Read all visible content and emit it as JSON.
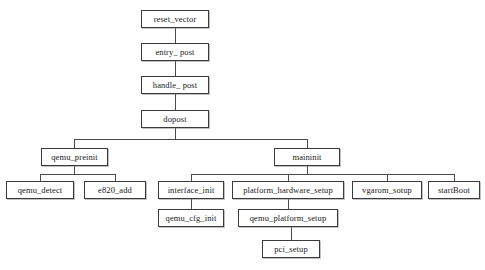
{
  "diagram": {
    "type": "flowchart-tree",
    "background_color": "#ffffff",
    "box_border_color": "#3a3a3a",
    "edge_color": "#4a4a4a",
    "text_color": "#1a1a1a",
    "nodes": [
      {
        "id": "reset_vector",
        "label": "reset_vector",
        "x": 141,
        "y": 10,
        "w": 68,
        "h": 18,
        "level": 0
      },
      {
        "id": "entry_post",
        "label": "entry_ post",
        "x": 141,
        "y": 43,
        "w": 68,
        "h": 18,
        "level": 1
      },
      {
        "id": "handle_post",
        "label": "handle_ post",
        "x": 141,
        "y": 76,
        "w": 68,
        "h": 18,
        "level": 2
      },
      {
        "id": "dopost",
        "label": "dopost",
        "x": 141,
        "y": 110,
        "w": 68,
        "h": 18,
        "level": 3
      },
      {
        "id": "qemu_preinit",
        "label": "qemu_preinit",
        "x": 41,
        "y": 148,
        "w": 67,
        "h": 18,
        "level": 4
      },
      {
        "id": "maininit",
        "label": "maininit",
        "x": 274,
        "y": 148,
        "w": 66,
        "h": 18,
        "level": 4
      },
      {
        "id": "qemu_detect",
        "label": "qemu_detect",
        "x": 6,
        "y": 181,
        "w": 68,
        "h": 18,
        "level": 5
      },
      {
        "id": "e820_add",
        "label": "e820_add",
        "x": 84,
        "y": 181,
        "w": 62,
        "h": 18,
        "level": 5
      },
      {
        "id": "interface_init",
        "label": "interface_init",
        "x": 158,
        "y": 181,
        "w": 66,
        "h": 18,
        "level": 5
      },
      {
        "id": "platform_hardware_setup",
        "label": "platform_hardware_setup",
        "x": 232,
        "y": 181,
        "w": 112,
        "h": 18,
        "level": 5
      },
      {
        "id": "vgarom_sotup",
        "label": "vgarom_sotup",
        "x": 352,
        "y": 181,
        "w": 70,
        "h": 18,
        "level": 5
      },
      {
        "id": "startBoot",
        "label": "startBoot",
        "x": 428,
        "y": 181,
        "w": 52,
        "h": 18,
        "level": 5
      },
      {
        "id": "qemu_cfg_init",
        "label": "qemu_cfg_init",
        "x": 158,
        "y": 209,
        "w": 66,
        "h": 18,
        "level": 6
      },
      {
        "id": "qemu_platform_setup",
        "label": "qemu_platform_setup",
        "x": 238,
        "y": 209,
        "w": 100,
        "h": 18,
        "level": 6
      },
      {
        "id": "pci_setup",
        "label": "pci_setup",
        "x": 262,
        "y": 240,
        "w": 58,
        "h": 18,
        "level": 7
      }
    ],
    "edges": [
      {
        "from": "reset_vector",
        "to": "entry_post",
        "style": "straight"
      },
      {
        "from": "entry_post",
        "to": "handle_post",
        "style": "straight"
      },
      {
        "from": "handle_post",
        "to": "dopost",
        "style": "straight"
      },
      {
        "from": "dopost",
        "to": "qemu_preinit",
        "style": "orthogonal"
      },
      {
        "from": "dopost",
        "to": "maininit",
        "style": "orthogonal"
      },
      {
        "from": "qemu_preinit",
        "to": "qemu_detect",
        "style": "orthogonal"
      },
      {
        "from": "qemu_preinit",
        "to": "e820_add",
        "style": "orthogonal"
      },
      {
        "from": "maininit",
        "to": "interface_init",
        "style": "orthogonal"
      },
      {
        "from": "maininit",
        "to": "platform_hardware_setup",
        "style": "orthogonal"
      },
      {
        "from": "maininit",
        "to": "vgarom_sotup",
        "style": "orthogonal"
      },
      {
        "from": "maininit",
        "to": "startBoot",
        "style": "orthogonal"
      },
      {
        "from": "interface_init",
        "to": "qemu_cfg_init",
        "style": "straight"
      },
      {
        "from": "platform_hardware_setup",
        "to": "qemu_platform_setup",
        "style": "straight"
      },
      {
        "from": "qemu_platform_setup",
        "to": "pci_setup",
        "style": "straight"
      }
    ],
    "segments": [
      {
        "name": "reset-to-entry",
        "o": "v",
        "x": 175,
        "y": 28,
        "len": 15
      },
      {
        "name": "entry-to-handle",
        "o": "v",
        "x": 175,
        "y": 61,
        "len": 15
      },
      {
        "name": "handle-to-dopost",
        "o": "v",
        "x": 175,
        "y": 94,
        "len": 16
      },
      {
        "name": "dopost-drop",
        "o": "v",
        "x": 175,
        "y": 128,
        "len": 11
      },
      {
        "name": "dopost-bus",
        "o": "h",
        "x": 74,
        "y": 139,
        "len": 233
      },
      {
        "name": "dopost-to-qemu-preinit",
        "o": "v",
        "x": 74,
        "y": 139,
        "len": 9
      },
      {
        "name": "dopost-to-maininit",
        "o": "v",
        "x": 307,
        "y": 139,
        "len": 9
      },
      {
        "name": "preinit-drop",
        "o": "v",
        "x": 74,
        "y": 166,
        "len": 8
      },
      {
        "name": "preinit-bus",
        "o": "h",
        "x": 40,
        "y": 174,
        "len": 75
      },
      {
        "name": "preinit-to-detect",
        "o": "v",
        "x": 40,
        "y": 174,
        "len": 7
      },
      {
        "name": "preinit-to-e820",
        "o": "v",
        "x": 115,
        "y": 174,
        "len": 7
      },
      {
        "name": "maininit-drop",
        "o": "v",
        "x": 307,
        "y": 166,
        "len": 8
      },
      {
        "name": "maininit-bus",
        "o": "h",
        "x": 191,
        "y": 174,
        "len": 263
      },
      {
        "name": "maininit-to-interface",
        "o": "v",
        "x": 191,
        "y": 174,
        "len": 7
      },
      {
        "name": "maininit-to-platform",
        "o": "v",
        "x": 288,
        "y": 174,
        "len": 7
      },
      {
        "name": "maininit-to-vgarom",
        "o": "v",
        "x": 387,
        "y": 174,
        "len": 7
      },
      {
        "name": "maininit-to-startboot",
        "o": "v",
        "x": 454,
        "y": 174,
        "len": 7
      },
      {
        "name": "interface-to-cfginit",
        "o": "v",
        "x": 191,
        "y": 199,
        "len": 10
      },
      {
        "name": "platform-to-qemuplatform",
        "o": "v",
        "x": 288,
        "y": 199,
        "len": 10
      },
      {
        "name": "qemuplatform-to-pcisetup",
        "o": "v",
        "x": 291,
        "y": 227,
        "len": 13
      }
    ]
  }
}
